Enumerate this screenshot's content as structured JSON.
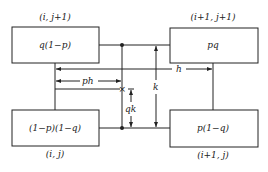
{
  "diagram": {
    "nodes": [
      {
        "id": "tl",
        "coord": "(i, j+1)",
        "value": "q(1−p)"
      },
      {
        "id": "tr",
        "coord": "(i+1, j+1)",
        "value": "pq"
      },
      {
        "id": "bl",
        "coord": "(i, j)",
        "value": "(1−p)(1−q)"
      },
      {
        "id": "br",
        "coord": "(i+1, j)",
        "value": "p(1−q)"
      }
    ],
    "dimensions": {
      "h": "h",
      "ph": "ph",
      "k": "k",
      "qk": "qk"
    },
    "point_marker": "×"
  }
}
